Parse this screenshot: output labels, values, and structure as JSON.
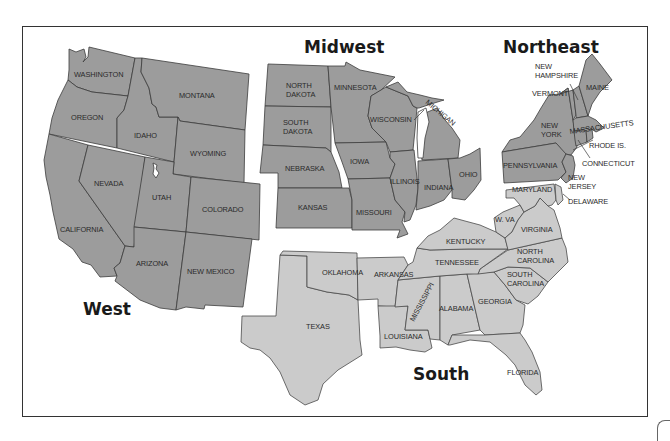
{
  "map": {
    "title": "United States Regions",
    "colors": {
      "region_fill": "#9c9c9c",
      "south_fill": "#cbcbcb",
      "border": "#333333",
      "background": "#ffffff"
    },
    "regions": [
      {
        "name": "West",
        "states": [
          "WASHINGTON",
          "OREGON",
          "CALIFORNIA",
          "IDAHO",
          "MONTANA",
          "WYOMING",
          "NEVADA",
          "UTAH",
          "COLORADO",
          "ARIZONA",
          "NEW MEXICO"
        ]
      },
      {
        "name": "Midwest",
        "states": [
          "NORTH DAKOTA",
          "SOUTH DAKOTA",
          "NEBRASKA",
          "KANSAS",
          "MINNESOTA",
          "IOWA",
          "MISSOURI",
          "WISCONSIN",
          "ILLINOIS",
          "MICHIGAN",
          "INDIANA",
          "OHIO"
        ]
      },
      {
        "name": "Northeast",
        "states": [
          "MAINE",
          "NEW HAMPSHIRE",
          "VERMONT",
          "MASSACHUSETTS",
          "RHODE IS.",
          "CONNECTICUT",
          "NEW YORK",
          "NEW JERSEY",
          "PENNSYLVANIA"
        ]
      },
      {
        "name": "South",
        "states": [
          "DELAWARE",
          "MARYLAND",
          "W. VA",
          "VIRGINIA",
          "KENTUCKY",
          "TENNESSEE",
          "NORTH CAROLINA",
          "SOUTH CAROLINA",
          "GEORGIA",
          "FLORIDA",
          "ALABAMA",
          "MISSISSIPPI",
          "LOUISIANA",
          "ARKANSAS",
          "OKLAHOMA",
          "TEXAS"
        ]
      }
    ],
    "labels": {
      "west": "West",
      "midwest": "Midwest",
      "northeast": "Northeast",
      "south": "South",
      "washington": "WASHINGTON",
      "oregon": "OREGON",
      "california": "CALIFORNIA",
      "idaho": "IDAHO",
      "montana": "MONTANA",
      "wyoming": "WYOMING",
      "nevada": "NEVADA",
      "utah": "UTAH",
      "colorado": "COLORADO",
      "arizona": "ARIZONA",
      "new_mexico": "NEW MEXICO",
      "north_dakota_1": "NORTH",
      "north_dakota_2": "DAKOTA",
      "south_dakota_1": "SOUTH",
      "south_dakota_2": "DAKOTA",
      "nebraska": "NEBRASKA",
      "kansas": "KANSAS",
      "minnesota": "MINNESOTA",
      "iowa": "IOWA",
      "missouri": "MISSOURI",
      "wisconsin": "WISCONSIN",
      "illinois": "ILLINOIS",
      "michigan": "MICHIGAN",
      "indiana": "INDIANA",
      "ohio": "OHIO",
      "new_hampshire_1": "NEW",
      "new_hampshire_2": "HAMPSHIRE",
      "vermont": "VERMONT",
      "maine": "MAINE",
      "new_york_1": "NEW",
      "new_york_2": "YORK",
      "massachusetts": "MASSACHUSETTS",
      "rhode_island": "RHODE IS.",
      "connecticut": "CONNECTICUT",
      "pennsylvania": "PENNSYLVANIA",
      "new_jersey_1": "NEW",
      "new_jersey_2": "JERSEY",
      "maryland": "MARYLAND",
      "delaware": "DELAWARE",
      "west_virginia": "W. VA",
      "virginia": "VIRGINIA",
      "kentucky": "KENTUCKY",
      "tennessee": "TENNESSEE",
      "north_carolina_1": "NORTH",
      "north_carolina_2": "CAROLINA",
      "south_carolina_1": "SOUTH",
      "south_carolina_2": "CAROLINA",
      "georgia": "GEORGIA",
      "alabama": "ALABAMA",
      "mississippi": "MISSISSIPPI",
      "louisiana": "LOUISIANA",
      "arkansas": "ARKANSAS",
      "oklahoma": "OKLAHOMA",
      "texas": "TEXAS",
      "florida": "FLORIDA"
    }
  }
}
